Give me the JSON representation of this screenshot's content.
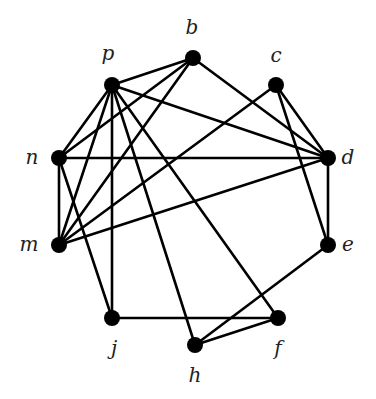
{
  "graph": {
    "nodes": [
      {
        "id": "p",
        "label": "p",
        "x": 112,
        "y": 85,
        "lx": 108,
        "ly": 60
      },
      {
        "id": "b",
        "label": "b",
        "x": 193,
        "y": 58,
        "lx": 192,
        "ly": 34
      },
      {
        "id": "c",
        "label": "c",
        "x": 276,
        "y": 85,
        "lx": 276,
        "ly": 62
      },
      {
        "id": "n",
        "label": "n",
        "x": 59,
        "y": 158,
        "lx": 32,
        "ly": 164
      },
      {
        "id": "d",
        "label": "d",
        "x": 328,
        "y": 158,
        "lx": 348,
        "ly": 164
      },
      {
        "id": "m",
        "label": "m",
        "x": 59,
        "y": 245,
        "lx": 29,
        "ly": 251
      },
      {
        "id": "e",
        "label": "e",
        "x": 328,
        "y": 245,
        "lx": 348,
        "ly": 251
      },
      {
        "id": "j",
        "label": "j",
        "x": 112,
        "y": 318,
        "lx": 114,
        "ly": 355
      },
      {
        "id": "h",
        "label": "h",
        "x": 195,
        "y": 345,
        "lx": 195,
        "ly": 382
      },
      {
        "id": "f",
        "label": "f",
        "x": 278,
        "y": 318,
        "lx": 278,
        "ly": 355
      }
    ],
    "edges": [
      [
        "p",
        "b"
      ],
      [
        "p",
        "d"
      ],
      [
        "p",
        "n"
      ],
      [
        "p",
        "m"
      ],
      [
        "p",
        "j"
      ],
      [
        "p",
        "h"
      ],
      [
        "p",
        "f"
      ],
      [
        "b",
        "n"
      ],
      [
        "b",
        "m"
      ],
      [
        "b",
        "d"
      ],
      [
        "c",
        "m"
      ],
      [
        "c",
        "d"
      ],
      [
        "c",
        "e"
      ],
      [
        "n",
        "d"
      ],
      [
        "n",
        "m"
      ],
      [
        "n",
        "j"
      ],
      [
        "m",
        "d"
      ],
      [
        "d",
        "e"
      ],
      [
        "e",
        "h"
      ],
      [
        "j",
        "f"
      ],
      [
        "h",
        "f"
      ]
    ]
  }
}
